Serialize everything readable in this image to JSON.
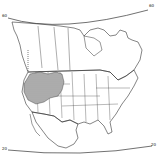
{
  "map": {
    "type": "range-map",
    "region": "North America (Canada, United States, Mexico)",
    "projection_labels": {
      "top_left": "60",
      "top_right": "60",
      "bottom_left": "20",
      "bottom_right": "20"
    },
    "shaded_region": {
      "description": "Hatched distribution range in western United States",
      "pattern": "horizontal-hatch",
      "dotted_extension": "northward dotted line into British Columbia"
    },
    "colors": {
      "background": "#ffffff",
      "lines": "#333333",
      "hatch": "#444444"
    }
  }
}
